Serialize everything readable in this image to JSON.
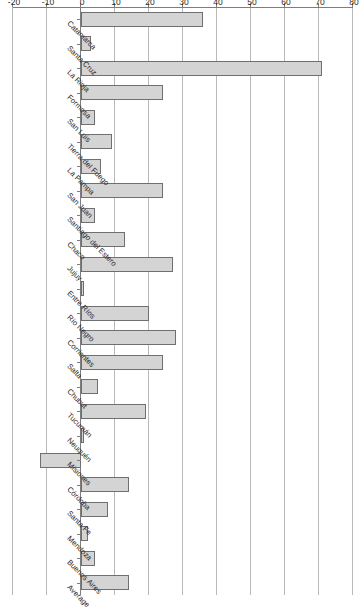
{
  "chart_data": {
    "type": "bar",
    "orientation": "vertical-rotated",
    "title": "",
    "subtitle": "",
    "xlabel": "",
    "ylabel": "",
    "ylim": [
      -20,
      80
    ],
    "grid": true,
    "legend": null,
    "y_ticks": [
      -20,
      -10,
      0,
      10,
      20,
      30,
      40,
      50,
      60,
      70,
      80
    ],
    "y_tick_labels": [
      "-20",
      "-10",
      "0",
      "10",
      "20",
      "30",
      "40",
      "50",
      "60",
      "70",
      "80"
    ],
    "categories": [
      "Catamarca",
      "Santa Cruz",
      "La Rioja",
      "Formosa",
      "San Luis",
      "Tierra del Fuego",
      "La Pampa",
      "San Juan",
      "Santiago del Estero",
      "Chaco",
      "Jujuy",
      "Entre Ríos",
      "Río Negro",
      "Corrientes",
      "Salta",
      "Chubut",
      "Tucumán",
      "Neuquén",
      "Misiones",
      "Córdoba",
      "Santa Fe",
      "Mendoza",
      "Buenos Aires",
      "Average"
    ],
    "values": [
      36,
      3,
      71,
      24,
      4,
      9,
      6,
      24,
      4,
      13,
      27,
      1,
      20,
      28,
      24,
      5,
      19,
      1,
      -12,
      14,
      8,
      2,
      4,
      14
    ],
    "bar_color": "#d4d4d4",
    "bar_edge_color": "#6f6f6f",
    "grid_color": "#b9b9b9",
    "axis_color": "#7d7d7d"
  }
}
